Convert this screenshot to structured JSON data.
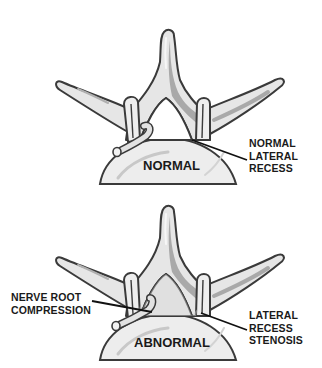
{
  "diagram": {
    "panels": [
      {
        "id": "normal",
        "title": "NORMAL",
        "callouts": [
          {
            "lines": [
              "NORMAL",
              "LATERAL",
              "RECESS"
            ],
            "side": "right"
          }
        ]
      },
      {
        "id": "abnormal",
        "title": "ABNORMAL",
        "callouts": [
          {
            "lines": [
              "NERVE ROOT",
              "COMPRESSION"
            ],
            "side": "left"
          },
          {
            "lines": [
              "LATERAL",
              "RECESS",
              "STENOSIS"
            ],
            "side": "right"
          }
        ]
      }
    ],
    "colors": {
      "outline": "#3a3a3a",
      "bone_fill": "#e6e6e6",
      "bone_shadow": "#a9a9a9",
      "highlight": "#f7f7f7",
      "body_fill": "#ededed",
      "leader": "#111111",
      "text": "#1a1a1a"
    }
  }
}
